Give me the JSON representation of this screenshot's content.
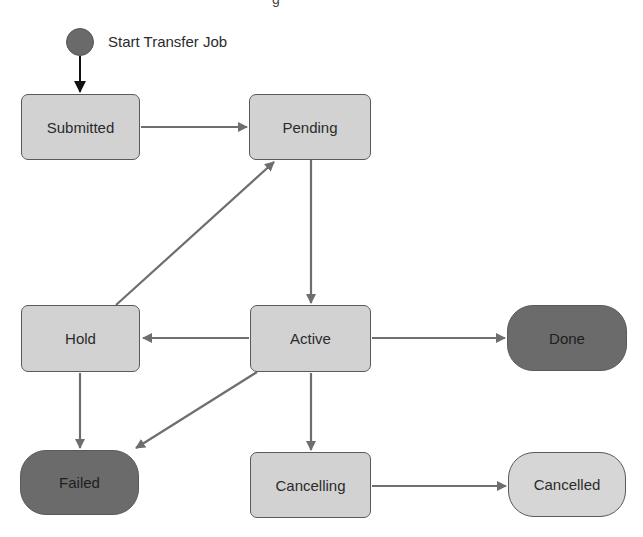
{
  "diagram": {
    "type": "state-machine",
    "top_fragment": "g",
    "start": {
      "label": "Start Transfer Job"
    },
    "colors": {
      "state_fill": "#d2d2d2",
      "final_dark_fill": "#6b6b6b",
      "final_light_fill": "#d6d6d6",
      "edge": "#6e6e6e",
      "start_edge": "#111111",
      "start_dot": "#6a6a6a"
    },
    "nodes": [
      {
        "id": "submitted",
        "label": "Submitted",
        "kind": "state"
      },
      {
        "id": "pending",
        "label": "Pending",
        "kind": "state"
      },
      {
        "id": "hold",
        "label": "Hold",
        "kind": "state"
      },
      {
        "id": "active",
        "label": "Active",
        "kind": "state"
      },
      {
        "id": "done",
        "label": "Done",
        "kind": "final-dark"
      },
      {
        "id": "failed",
        "label": "Failed",
        "kind": "final-dark"
      },
      {
        "id": "cancelling",
        "label": "Cancelling",
        "kind": "state"
      },
      {
        "id": "cancelled",
        "label": "Cancelled",
        "kind": "final-light"
      }
    ],
    "edges": [
      {
        "from": "start",
        "to": "submitted"
      },
      {
        "from": "submitted",
        "to": "pending"
      },
      {
        "from": "pending",
        "to": "active"
      },
      {
        "from": "hold",
        "to": "pending"
      },
      {
        "from": "active",
        "to": "hold"
      },
      {
        "from": "active",
        "to": "done"
      },
      {
        "from": "active",
        "to": "failed"
      },
      {
        "from": "hold",
        "to": "failed"
      },
      {
        "from": "active",
        "to": "cancelling"
      },
      {
        "from": "cancelling",
        "to": "cancelled"
      }
    ]
  }
}
